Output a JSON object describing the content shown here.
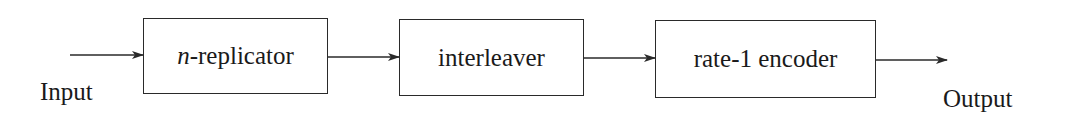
{
  "diagram": {
    "type": "block-diagram",
    "direction": "left-to-right",
    "input_label": "Input",
    "output_label": "Output",
    "blocks": [
      {
        "id": "replicator",
        "var": "n",
        "text": "-replicator",
        "full_label": "n-replicator"
      },
      {
        "id": "interleaver",
        "text": "interleaver",
        "full_label": "interleaver"
      },
      {
        "id": "encoder",
        "text": "rate-1 encoder",
        "full_label": "rate-1 encoder"
      }
    ],
    "edges": [
      {
        "from": "Input",
        "to": "n-replicator"
      },
      {
        "from": "n-replicator",
        "to": "interleaver"
      },
      {
        "from": "interleaver",
        "to": "rate-1 encoder"
      },
      {
        "from": "rate-1 encoder",
        "to": "Output"
      }
    ],
    "colors": {
      "stroke": "#2a2a2a",
      "text": "#1a1a1a",
      "background": "#ffffff"
    }
  }
}
